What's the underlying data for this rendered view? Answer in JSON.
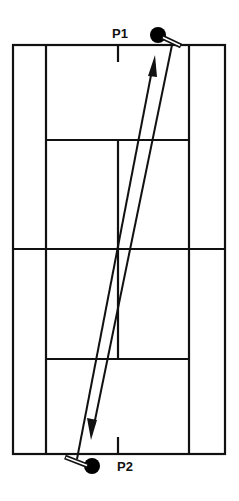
{
  "diagram": {
    "colors": {
      "line": "#111111",
      "background": "#ffffff",
      "player": "#000000"
    },
    "players": [
      {
        "id": "p1",
        "label": "P1",
        "position": "top baseline, right of center"
      },
      {
        "id": "p2",
        "label": "P2",
        "position": "bottom baseline, left of center"
      }
    ],
    "shots": [
      {
        "from": "P2",
        "to": "P1",
        "direction": "up",
        "arrow": "arrowhead near P1"
      },
      {
        "from": "P1",
        "to": "P2",
        "direction": "down",
        "arrow": "arrowhead near P2"
      }
    ]
  }
}
